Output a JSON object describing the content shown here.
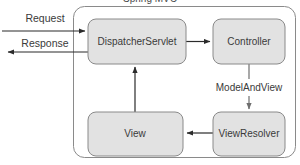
{
  "diagram": {
    "type": "flow-diagram",
    "title_truncated": "Spring MVC",
    "container": {
      "name": "spring-mvc-container",
      "label": ""
    },
    "nodes": [
      {
        "id": "dispatcher-servlet",
        "label": "DispatcherServlet",
        "x": 88,
        "y": 19,
        "w": 98,
        "h": 45
      },
      {
        "id": "controller",
        "label": "Controller",
        "x": 213,
        "y": 19,
        "w": 72,
        "h": 45
      },
      {
        "id": "view",
        "label": "View",
        "x": 88,
        "y": 112,
        "w": 95,
        "h": 44
      },
      {
        "id": "view-resolver",
        "label": "ViewResolver",
        "x": 213,
        "y": 112,
        "w": 72,
        "h": 44
      }
    ],
    "edges": [
      {
        "id": "request-edge",
        "label": "Request",
        "from": "external",
        "to": "dispatcher-servlet"
      },
      {
        "id": "response-edge",
        "label": "Response",
        "from": "dispatcher-servlet",
        "to": "external"
      },
      {
        "id": "dispatcher-to-controller-edge",
        "label": "",
        "from": "dispatcher-servlet",
        "to": "controller"
      },
      {
        "id": "controller-to-resolver-edge",
        "label": "ModelAndView",
        "from": "controller",
        "to": "view-resolver"
      },
      {
        "id": "resolver-to-view-edge",
        "label": "",
        "from": "view-resolver",
        "to": "view"
      },
      {
        "id": "view-to-dispatcher-edge",
        "label": "",
        "from": "view",
        "to": "dispatcher-servlet"
      }
    ],
    "colors": {
      "node_fill": "#e2e2e2",
      "node_stroke": "#8a8a8a",
      "edge_stroke": "#2b2b2b",
      "edge_stroke_gray": "#6f6f6f",
      "text": "#3a3a3a",
      "background": "#ffffff"
    }
  }
}
